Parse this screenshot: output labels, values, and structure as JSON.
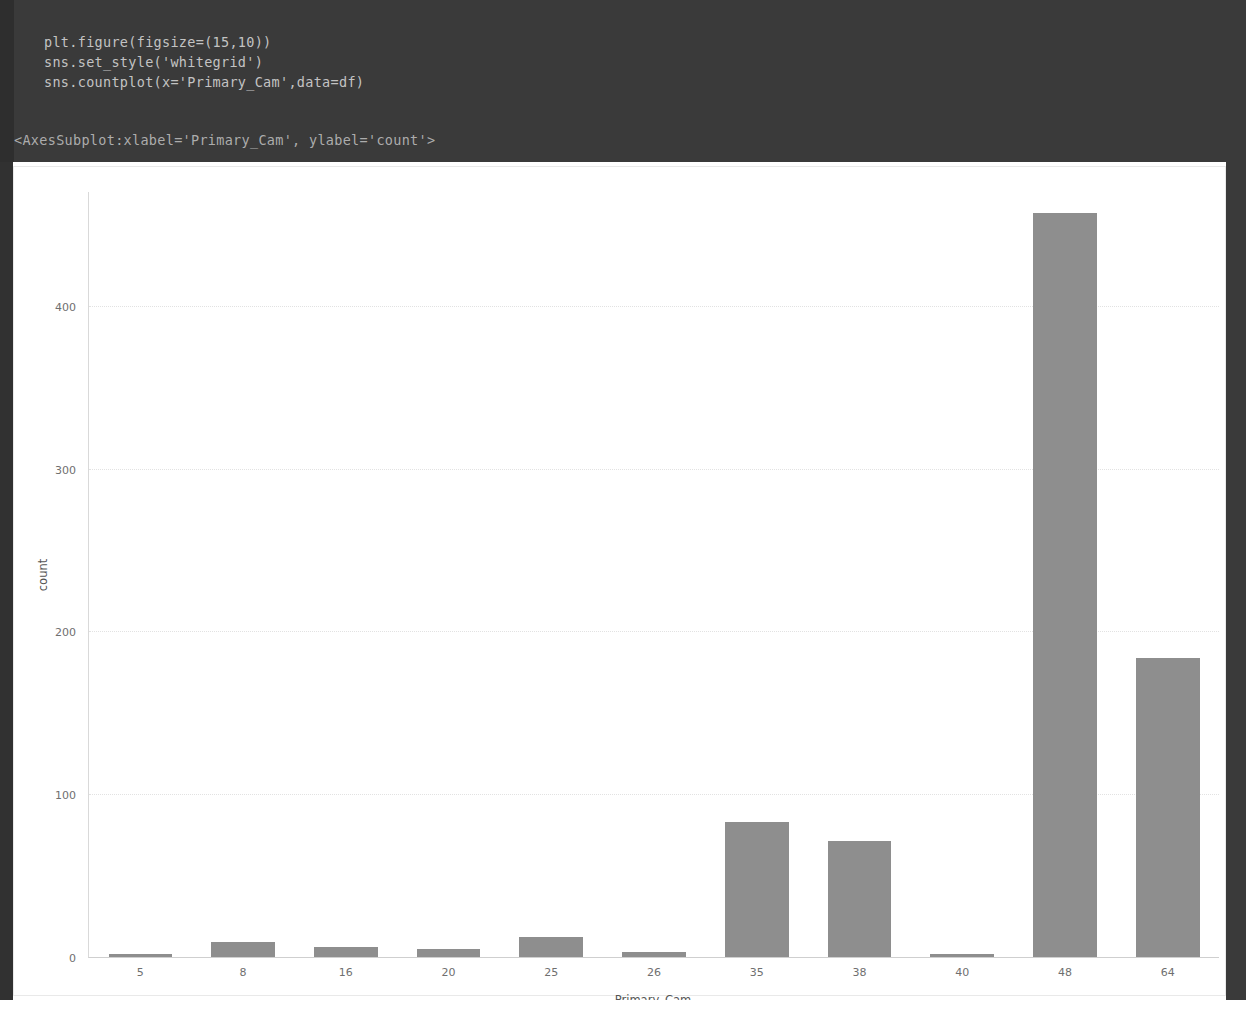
{
  "notebook": {
    "code_lines": [
      "plt.figure(figsize=(15,10))",
      "sns.set_style('whitegrid')",
      "sns.countplot(x='Primary_Cam',data=df)"
    ],
    "output_text": "<AxesSubplot:xlabel='Primary_Cam', ylabel='count'>"
  },
  "colors": {
    "code_background": "#3a3a3a",
    "code_text": "#cfcfcf",
    "bar_fill": "#8e8e8e",
    "grid": "#e2e2e2",
    "figure_background": "#ffffff"
  },
  "chart_data": {
    "type": "bar",
    "title": "",
    "xlabel": "Primary_Cam",
    "ylabel": "count",
    "categories": [
      "5",
      "8",
      "16",
      "20",
      "25",
      "26",
      "35",
      "38",
      "40",
      "48",
      "64"
    ],
    "values": [
      2,
      9,
      6,
      5,
      12,
      3,
      83,
      71,
      2,
      457,
      184
    ],
    "ylim": [
      0,
      470
    ],
    "yticks": [
      0,
      100,
      200,
      300,
      400
    ],
    "ytick_labels": [
      "0",
      "100",
      "200",
      "300",
      "400"
    ],
    "grid": true,
    "legend": "none",
    "style": "whitegrid"
  }
}
